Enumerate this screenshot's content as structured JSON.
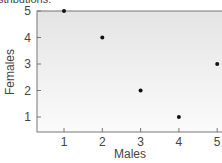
{
  "caption": "stributions.",
  "chart_data": {
    "type": "scatter",
    "title": "",
    "xlabel": "Males",
    "ylabel": "Females",
    "x": [
      1,
      2,
      3,
      4,
      5
    ],
    "y": [
      5,
      4,
      2,
      1,
      3
    ],
    "xticks": [
      "1",
      "2",
      "3",
      "4",
      "5"
    ],
    "yticks": [
      "1",
      "2",
      "3",
      "4",
      "5"
    ],
    "xlim": [
      0.3,
      5
    ],
    "ylim": [
      0.6,
      5
    ],
    "grid": false,
    "legend": null,
    "colors": {
      "point": "#111111",
      "plot_bg_top": "#e6e6e6",
      "plot_bg_bottom": "#fafafa",
      "axis": "#666666"
    }
  }
}
